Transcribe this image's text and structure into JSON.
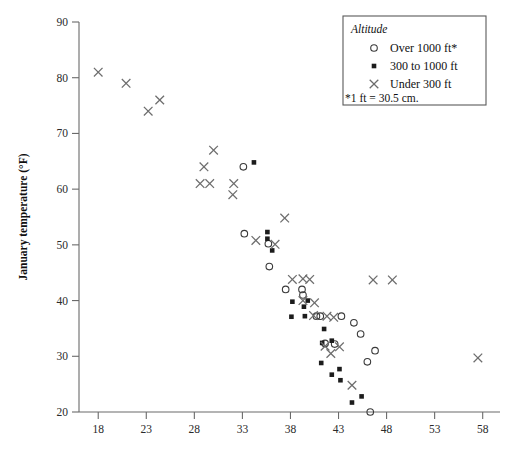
{
  "chart_data": {
    "type": "scatter",
    "title": "",
    "xlabel": "",
    "ylabel": "January temperature (°F)",
    "xlim": [
      16.0,
      59.8
    ],
    "ylim": [
      20,
      90
    ],
    "xticks": [
      18,
      23,
      28,
      33,
      38,
      43,
      48,
      53,
      58
    ],
    "yticks": [
      20,
      30,
      40,
      50,
      60,
      70,
      80,
      90
    ],
    "grid": false,
    "legend": {
      "position": "top-right",
      "title": "Altitude",
      "note": "*1 ft = 30.5 cm.",
      "entries": [
        {
          "label": "Over 1000 ft*",
          "marker": "open-circle"
        },
        {
          "label": "300 to 1000 ft",
          "marker": "filled-square"
        },
        {
          "label": "Under 300 ft",
          "marker": "cross"
        }
      ]
    },
    "series": [
      {
        "name": "Over 1000 ft*",
        "marker": "open-circle",
        "points": [
          [
            33.1,
            64.0
          ],
          [
            33.2,
            52.0
          ],
          [
            35.7,
            50.2
          ],
          [
            35.8,
            46.1
          ],
          [
            37.5,
            42.0
          ],
          [
            39.2,
            42.0
          ],
          [
            39.3,
            41.0
          ],
          [
            40.7,
            37.2
          ],
          [
            41.1,
            37.2
          ],
          [
            43.3,
            37.2
          ],
          [
            41.6,
            32.3
          ],
          [
            44.6,
            36.0
          ],
          [
            45.3,
            34.0
          ],
          [
            46.8,
            31.0
          ],
          [
            46.0,
            29.0
          ],
          [
            42.6,
            32.2
          ],
          [
            46.3,
            20.0
          ]
        ]
      },
      {
        "name": "300 to 1000 ft",
        "marker": "filled-square",
        "points": [
          [
            34.2,
            64.8
          ],
          [
            35.6,
            52.3
          ],
          [
            35.6,
            51.1
          ],
          [
            36.1,
            49.0
          ],
          [
            38.2,
            39.8
          ],
          [
            39.4,
            38.9
          ],
          [
            38.1,
            37.1
          ],
          [
            41.5,
            34.9
          ],
          [
            41.3,
            32.4
          ],
          [
            42.3,
            32.8
          ],
          [
            41.2,
            28.8
          ],
          [
            42.3,
            26.7
          ],
          [
            43.1,
            27.7
          ],
          [
            43.2,
            25.7
          ],
          [
            44.4,
            21.7
          ],
          [
            45.4,
            22.8
          ],
          [
            39.8,
            40.0
          ],
          [
            39.5,
            37.2
          ]
        ]
      },
      {
        "name": "Under 300 ft",
        "marker": "cross",
        "points": [
          [
            18.0,
            81.0
          ],
          [
            20.9,
            79.0
          ],
          [
            24.4,
            76.0
          ],
          [
            23.2,
            74.0
          ],
          [
            30.0,
            67.0
          ],
          [
            29.0,
            64.0
          ],
          [
            28.6,
            61.0
          ],
          [
            29.6,
            61.0
          ],
          [
            32.1,
            61.0
          ],
          [
            32.0,
            59.0
          ],
          [
            37.4,
            54.8
          ],
          [
            34.4,
            50.8
          ],
          [
            36.4,
            50.1
          ],
          [
            38.2,
            43.8
          ],
          [
            39.3,
            43.9
          ],
          [
            40.0,
            43.8
          ],
          [
            39.3,
            40.0
          ],
          [
            40.5,
            39.6
          ],
          [
            40.4,
            37.3
          ],
          [
            41.8,
            37.2
          ],
          [
            42.5,
            37.0
          ],
          [
            41.6,
            31.8
          ],
          [
            42.2,
            30.5
          ],
          [
            43.1,
            31.7
          ],
          [
            44.4,
            24.8
          ],
          [
            46.6,
            43.7
          ],
          [
            48.6,
            43.7
          ],
          [
            57.5,
            29.7
          ]
        ]
      }
    ]
  }
}
